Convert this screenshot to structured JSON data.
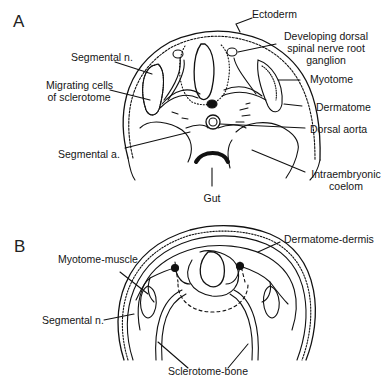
{
  "figure": {
    "panels": [
      {
        "id": "A",
        "label": "A",
        "annotations": {
          "ectoderm": "Ectoderm",
          "drg_line1": "Developing dorsal",
          "drg_line2": "spinal nerve root",
          "drg_line3": "ganglion",
          "segmental_n": "Segmental n.",
          "migrating_line1": "Migrating cells",
          "migrating_line2": "of sclerotome",
          "myotome": "Myotome",
          "dermatome": "Dermatome",
          "dorsal_aorta": "Dorsal aorta",
          "segmental_a": "Segmental a.",
          "coelom_line1": "Intraembryonic",
          "coelom_line2": "coelom",
          "gut": "Gut"
        }
      },
      {
        "id": "B",
        "label": "B",
        "annotations": {
          "dermatome_dermis": "Dermatome-dermis",
          "myotome_muscle": "Myotome-muscle",
          "segmental_n": "Segmental n.",
          "sclerotome_bone": "Sclerotome-bone"
        }
      }
    ],
    "colors": {
      "ink": "#111111",
      "background": "#ffffff"
    }
  }
}
